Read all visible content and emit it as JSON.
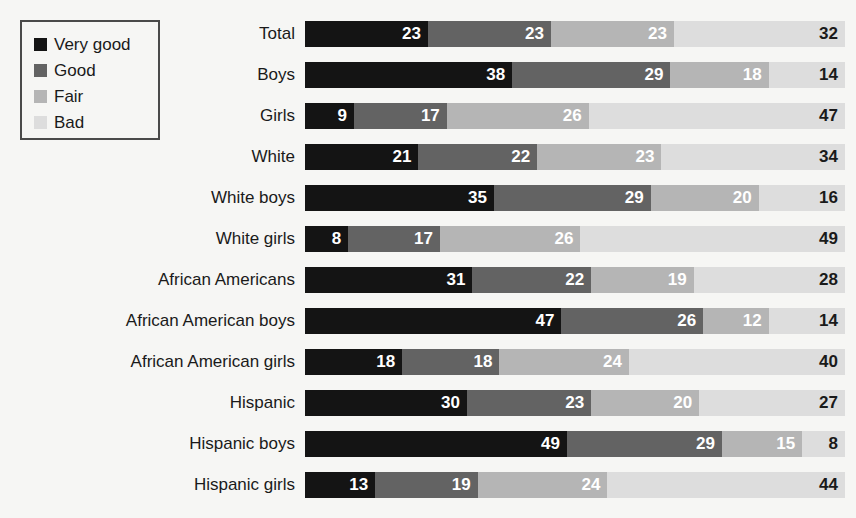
{
  "legend": {
    "items": [
      {
        "label": "Very good",
        "color": "#141414"
      },
      {
        "label": "Good",
        "color": "#636363"
      },
      {
        "label": "Fair",
        "color": "#b5b5b5"
      },
      {
        "label": "Bad",
        "color": "#dddddd"
      }
    ]
  },
  "chart_data": {
    "type": "bar",
    "orientation": "horizontal",
    "stacked": true,
    "normalized_percent": true,
    "title": "",
    "subtitle": "",
    "xlabel": "",
    "ylabel": "",
    "xlim": [
      0,
      100
    ],
    "grid": false,
    "legend_position": "top-left",
    "series": [
      {
        "name": "Very good",
        "color": "#141414",
        "values": [
          23,
          38,
          9,
          21,
          35,
          8,
          31,
          47,
          18,
          30,
          49,
          13
        ]
      },
      {
        "name": "Good",
        "color": "#636363",
        "values": [
          23,
          29,
          17,
          22,
          29,
          17,
          22,
          26,
          18,
          23,
          29,
          19
        ]
      },
      {
        "name": "Fair",
        "color": "#b5b5b5",
        "values": [
          23,
          18,
          26,
          23,
          20,
          26,
          19,
          12,
          24,
          20,
          15,
          24
        ]
      },
      {
        "name": "Bad",
        "color": "#dddddd",
        "values": [
          32,
          14,
          47,
          34,
          16,
          49,
          28,
          14,
          40,
          27,
          8,
          44
        ]
      }
    ],
    "categories": [
      "Total",
      "Boys",
      "Girls",
      "White",
      "White boys",
      "White girls",
      "African Americans",
      "African American boys",
      "African American girls",
      "Hispanic",
      "Hispanic boys",
      "Hispanic girls"
    ]
  },
  "layout": {
    "bar_left_px": 305,
    "bar_full_width_px": 540,
    "row_top_px": 21,
    "row_pitch_px": 41,
    "bar_height_px": 26,
    "background": "#f6f6f4"
  }
}
